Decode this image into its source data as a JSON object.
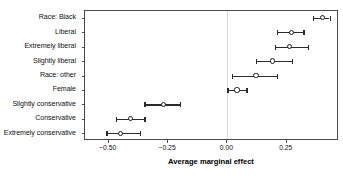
{
  "chart_data": {
    "type": "scatter",
    "title": "",
    "subtitle": "",
    "xlabel": "Average marginal effect",
    "ylabel": "",
    "xlim": [
      -0.6,
      0.47
    ],
    "xticks": [
      -0.5,
      -0.25,
      0.0,
      0.25
    ],
    "xticklabels": [
      "−0.50",
      "−0.25",
      "0.00",
      "0.25"
    ],
    "grid": false,
    "legend": null,
    "reference_line": 0.0,
    "categories": [
      "Race: Black",
      "Liberal",
      "Extremely liberal",
      "Slightly liberal",
      "Race: other",
      "Female",
      "Slightly conservative",
      "Conservative",
      "Extremely conservative"
    ],
    "values": [
      0.4,
      0.27,
      0.26,
      0.19,
      0.12,
      0.04,
      -0.27,
      -0.41,
      -0.45
    ],
    "ci_low": [
      0.36,
      0.21,
      0.2,
      0.12,
      0.02,
      0.0,
      -0.35,
      -0.47,
      -0.51
    ],
    "ci_high": [
      0.43,
      0.32,
      0.34,
      0.27,
      0.21,
      0.08,
      -0.2,
      -0.35,
      -0.37
    ],
    "points": [
      {
        "label": "Race: Black",
        "value": 0.4,
        "ci_low": 0.36,
        "ci_high": 0.43
      },
      {
        "label": "Liberal",
        "value": 0.27,
        "ci_low": 0.21,
        "ci_high": 0.32
      },
      {
        "label": "Extremely liberal",
        "value": 0.26,
        "ci_low": 0.2,
        "ci_high": 0.34
      },
      {
        "label": "Slightly liberal",
        "value": 0.19,
        "ci_low": 0.12,
        "ci_high": 0.27
      },
      {
        "label": "Race: other",
        "value": 0.12,
        "ci_low": 0.02,
        "ci_high": 0.21
      },
      {
        "label": "Female",
        "value": 0.04,
        "ci_low": 0.0,
        "ci_high": 0.08
      },
      {
        "label": "Slightly conservative",
        "value": -0.27,
        "ci_low": -0.35,
        "ci_high": -0.2
      },
      {
        "label": "Conservative",
        "value": -0.41,
        "ci_low": -0.47,
        "ci_high": -0.35
      },
      {
        "label": "Extremely conservative",
        "value": -0.45,
        "ci_low": -0.51,
        "ci_high": -0.37
      }
    ],
    "colors": {
      "marker": "#1a1a1a",
      "marker_fill": "#ffffff",
      "whisker": "#2b2b2b",
      "frame": "#4a4a4a",
      "reference_line": "#d8d8d8",
      "background": "#ffffff",
      "text": "#111111"
    }
  }
}
